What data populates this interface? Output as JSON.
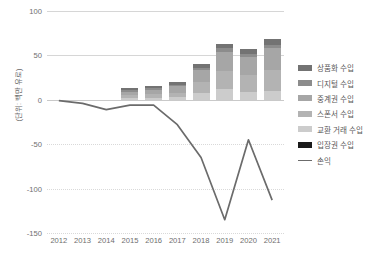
{
  "chart_data": {
    "type": "bar",
    "title": "",
    "subtitle": "",
    "xlabel": "",
    "ylabel": "(단위: 백만 유로)",
    "categories": [
      "2012",
      "2013",
      "2014",
      "2015",
      "2016",
      "2017",
      "2018",
      "2019",
      "2020",
      "2021"
    ],
    "ylim": [
      -150,
      100
    ],
    "yticks": [
      100,
      50,
      0,
      -50,
      -100,
      -150
    ],
    "ytick_labels": [
      "100",
      "50",
      "0",
      "-50",
      "-100",
      "-150"
    ],
    "grid": true,
    "legend_position": "right",
    "stacked": true,
    "series": [
      {
        "name": "상품화 수입",
        "color": "#737373",
        "values": [
          0,
          0,
          0,
          2,
          2,
          3,
          4,
          5,
          5,
          6
        ]
      },
      {
        "name": "디지털 수입",
        "color": "#8c8c8c",
        "values": [
          0,
          0,
          0,
          2,
          2,
          2,
          3,
          4,
          4,
          4
        ]
      },
      {
        "name": "중계권 수입",
        "color": "#a6a6a6",
        "values": [
          0,
          0,
          0,
          4,
          5,
          7,
          13,
          22,
          20,
          25
        ]
      },
      {
        "name": "스폰서 수입",
        "color": "#b3b3b3",
        "values": [
          0,
          0,
          0,
          3,
          4,
          5,
          12,
          20,
          19,
          23
        ]
      },
      {
        "name": "교환 거래 수입",
        "color": "#cccccc",
        "values": [
          0,
          0,
          0,
          2,
          2,
          3,
          8,
          12,
          9,
          10
        ]
      },
      {
        "name": "입장권 수입",
        "color": "#1a1a1a",
        "values": [
          0,
          0,
          0,
          0,
          0,
          0,
          0,
          0,
          0,
          0
        ]
      }
    ],
    "line_series": {
      "name": "손익",
      "color": "#6b6b6b",
      "values": [
        -1,
        -4,
        -11,
        -6,
        -6,
        -28,
        -65,
        -135,
        -45,
        -113
      ]
    },
    "totals": [
      0,
      0,
      0,
      13,
      15,
      20,
      40,
      63,
      57,
      68
    ]
  },
  "legend": {
    "items": [
      {
        "label": "상품화 수입",
        "color": "#737373",
        "type": "swatch"
      },
      {
        "label": "디지털 수입",
        "color": "#8c8c8c",
        "type": "swatch"
      },
      {
        "label": "중계권 수입",
        "color": "#a6a6a6",
        "type": "swatch"
      },
      {
        "label": "스폰서 수입",
        "color": "#b3b3b3",
        "type": "swatch"
      },
      {
        "label": "교환 거래 수입",
        "color": "#cccccc",
        "type": "swatch"
      },
      {
        "label": "입장권 수입",
        "color": "#1a1a1a",
        "type": "swatch"
      },
      {
        "label": "손익",
        "color": "#6b6b6b",
        "type": "line"
      }
    ]
  },
  "colors": {
    "grid": "#d9d9d9",
    "axis": "#c9c9c9",
    "text": "#6e6e6e",
    "line": "#6b6b6b",
    "background": "#ffffff"
  }
}
